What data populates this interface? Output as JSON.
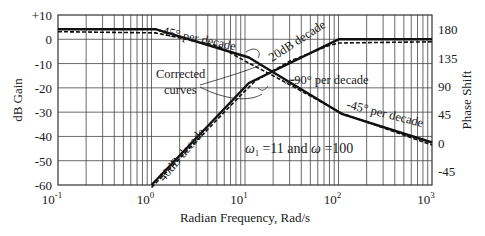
{
  "chart_data": {
    "type": "line",
    "title": "",
    "xlabel": "Radian Frequency, Rad/s",
    "ylabel": "dB Gain",
    "y2label": "Phase Shift",
    "xscale": "log",
    "xlim": [
      0.1,
      1000
    ],
    "ylim": [
      -60,
      10
    ],
    "y2lim": [
      -67.5,
      202.5
    ],
    "grid": true,
    "x_tick_labels": [
      "10^-1",
      "10^0",
      "10^1",
      "10^2",
      "10^3"
    ],
    "y_tick_labels": [
      "+10",
      "0",
      "-10",
      "-20",
      "-30",
      "-40",
      "-50",
      "-60"
    ],
    "y2_tick_labels": [
      "180",
      "135",
      "90",
      "45",
      "0",
      "-45"
    ],
    "series": [
      {
        "name": "Gain (asymptotic)",
        "axis": "left",
        "x": [
          1,
          11,
          100,
          1000
        ],
        "values": [
          -60,
          -18,
          0,
          0
        ]
      },
      {
        "name": "Gain (corrected)",
        "axis": "left",
        "style": "dashed",
        "x": [
          1,
          9,
          13,
          30,
          80,
          100,
          1000
        ],
        "values": [
          -60,
          -22,
          -16,
          -8,
          -1.5,
          -0.5,
          0
        ]
      },
      {
        "name": "Phase (asymptotic)",
        "axis": "right",
        "x": [
          0.1,
          1.1,
          11,
          110,
          1000
        ],
        "values": [
          180,
          180,
          135,
          45,
          0
        ]
      },
      {
        "name": "Phase (corrected)",
        "axis": "right",
        "style": "dashed",
        "x": [
          0.1,
          1.1,
          5,
          11,
          20,
          110,
          1000
        ],
        "values": [
          180,
          178,
          158,
          130,
          110,
          50,
          0
        ]
      }
    ],
    "annotations": [
      "-45° per decade",
      "20dB decade",
      "-90° per decade",
      "-45° per decade",
      "40dB decade",
      "Corrected curves",
      "ω1 = 11 and ω = 100"
    ]
  },
  "labels": {
    "xlabel": "Radian Frequency, Rad/s",
    "ylabel": "dB Gain",
    "y2label": "Phase Shift",
    "ann_phase1": "-45° per decade",
    "ann_gain20": "20dB decade",
    "ann_phase2": "-90° per decade",
    "ann_phase3": "-45° per decade",
    "ann_gain40": "40dB decade",
    "ann_corrected1": "Corrected",
    "ann_corrected2": "curves",
    "ann_omega_a": "ω",
    "ann_omega_sub": "1",
    "ann_omega_b": " =11 and ",
    "ann_omega_c": "ω",
    "ann_omega_d": " =100"
  },
  "yticks": [
    "+10",
    "0",
    "-10",
    "-20",
    "-30",
    "-40",
    "-50",
    "-60"
  ],
  "y2ticks": [
    "180",
    "135",
    "90",
    "45",
    "0",
    "-45"
  ],
  "xticks": [
    {
      "base": "10",
      "exp": "-1"
    },
    {
      "base": "10",
      "exp": "0"
    },
    {
      "base": "10",
      "exp": "1"
    },
    {
      "base": "10",
      "exp": "2"
    },
    {
      "base": "10",
      "exp": "3"
    }
  ]
}
